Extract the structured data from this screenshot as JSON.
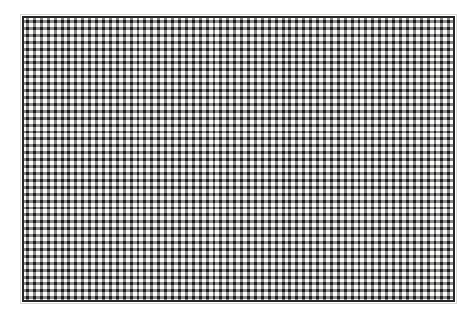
{
  "image": {
    "subject": "woven wire mesh screen panel",
    "medium": "scanned halftone print",
    "background_color": "#ffffff",
    "canvas_width": 475,
    "canvas_height": 318
  },
  "panel": {
    "label": "mesh panel",
    "left": 22,
    "top": 16,
    "width": 433,
    "height": 286,
    "fill_color": "#fcfcfa",
    "frame_color": "#262626",
    "frame_width": 2,
    "halo_color": "#d8d8d4"
  },
  "weave": {
    "label": "woven lattice",
    "cell_pitch_px": 6.92,
    "columns": 62,
    "rows": 41,
    "node_color": "#1c1c1c",
    "strand_color": "#8a8a8a",
    "strand_light_color": "#b8b8b8",
    "gap_color": "#fbfbf9",
    "node_size_px": 3.4,
    "strand_thickness_px": 1.4,
    "orientation": "orthogonal",
    "description": "dark cross-shaped intersection nodes joined by lighter dashed warp and weft strands"
  },
  "margins": {
    "label": "white paper margin",
    "top": 16,
    "right": 20,
    "bottom": 16,
    "left": 22
  }
}
